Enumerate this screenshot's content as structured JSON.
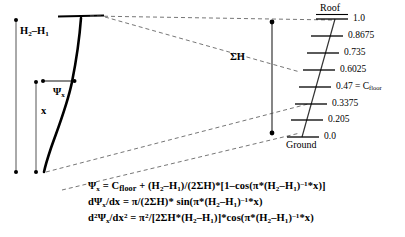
{
  "figure": {
    "background": "#ffffff",
    "stroke": "#000000"
  },
  "left_diagram": {
    "height_label": "H2–H1",
    "height_label_parts": {
      "base1": "H",
      "sub1": "2",
      "minus": "–",
      "base2": "H",
      "sub2": "1"
    },
    "x_label": "x",
    "psi_label": "Ψx",
    "psi_label_parts": {
      "base": "Ψ",
      "sub": "x"
    }
  },
  "middle": {
    "sum_h_label": "ΣH"
  },
  "scale": {
    "top_cap": "Roof",
    "bottom_cap": "Ground",
    "ticks": [
      {
        "value": "1.0",
        "note": ""
      },
      {
        "value": "0.8675",
        "note": ""
      },
      {
        "value": "0.735",
        "note": ""
      },
      {
        "value": "0.6025",
        "note": ""
      },
      {
        "value": "0.47",
        "note": "= Cfloor"
      },
      {
        "value": "0.3375",
        "note": ""
      },
      {
        "value": "0.205",
        "note": ""
      },
      {
        "value": "0.0",
        "note": ""
      }
    ],
    "cfloor_equals": "=",
    "cfloor_base": "C",
    "cfloor_sub": "floor"
  },
  "equations": {
    "line1": "Ψx = Cfloor + (H2–H1)/(2ΣH)*[1–cos(π*(H2–H1)^-1*x)]",
    "line2": "dΨx/dx = π/(2ΣH)* sin(π*(H2–H1)^-1*x)",
    "line3": "d2Ψx/dx2 = π2/[2ΣH*(H2–H1)]*cos(π*(H2–H1)^-1*x)"
  }
}
